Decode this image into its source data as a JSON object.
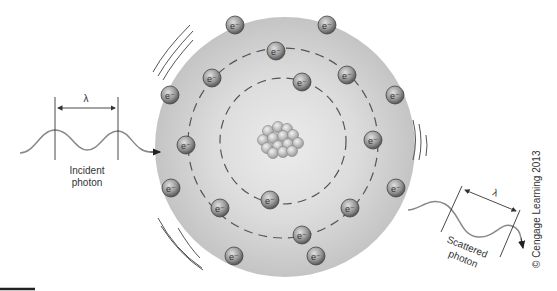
{
  "diagram": {
    "incident": {
      "label_line1": "Incident",
      "label_line2": "photon",
      "wavelength_symbol": "λ"
    },
    "scattered": {
      "label_line1": "Scattered",
      "label_line2": "photon",
      "wavelength_symbol": "λ"
    },
    "electron_label": "e⁻",
    "copyright": "© Cengage Learning 2013",
    "colors": {
      "atom_fill": "#c8c8c8",
      "atom_inner": "#e4e4e4",
      "electron": "#8a8a8a",
      "wave": "#777777",
      "lines": "#444444"
    },
    "electrons": [
      {
        "x": 235,
        "y": 25
      },
      {
        "x": 327,
        "y": 25
      },
      {
        "x": 212,
        "y": 78
      },
      {
        "x": 276,
        "y": 51
      },
      {
        "x": 347,
        "y": 75
      },
      {
        "x": 302,
        "y": 82
      },
      {
        "x": 170,
        "y": 95
      },
      {
        "x": 395,
        "y": 95
      },
      {
        "x": 186,
        "y": 145
      },
      {
        "x": 373,
        "y": 140
      },
      {
        "x": 171,
        "y": 188
      },
      {
        "x": 396,
        "y": 188
      },
      {
        "x": 220,
        "y": 208
      },
      {
        "x": 270,
        "y": 200
      },
      {
        "x": 350,
        "y": 208
      },
      {
        "x": 302,
        "y": 235
      },
      {
        "x": 234,
        "y": 256
      },
      {
        "x": 316,
        "y": 256
      }
    ]
  }
}
